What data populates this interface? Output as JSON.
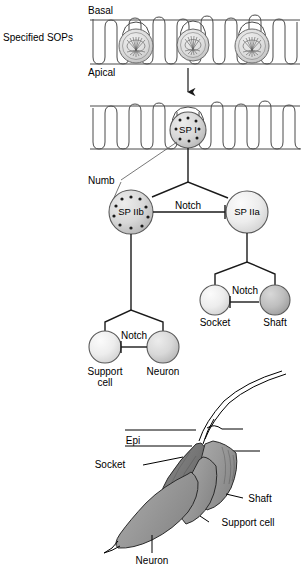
{
  "figure": {
    "title_present": false,
    "type": "biological-lineage-diagram"
  },
  "colors": {
    "cell_light": "#e8e8e8",
    "cell_mid": "#d0d0d0",
    "cell_dark": "#b8b8b8",
    "outline": "#4a4a4a",
    "line": "#1a1a1a",
    "organ_fill": "#9b9b9b",
    "organ_fill_dark": "#777777",
    "background": "#ffffff"
  },
  "panel_top": {
    "row_label": "Specified SOPs",
    "basal_label": "Basal",
    "apical_label": "Apical",
    "sop_count": 3,
    "arrow": "down-arrow"
  },
  "panel_lineage": {
    "numb_label": "Numb",
    "nodes": [
      {
        "id": "spi",
        "label": "SP I",
        "speckled": true,
        "shade": "cell_mid"
      },
      {
        "id": "spiib",
        "label": "SP IIb",
        "speckled": true,
        "shade": "cell_mid"
      },
      {
        "id": "spiia",
        "label": "SP IIa",
        "speckled": false,
        "shade": "cell_light"
      },
      {
        "id": "support",
        "label": "Support",
        "label2": "cell",
        "speckled": false,
        "shade": "cell_light"
      },
      {
        "id": "neuron",
        "label": "Neuron",
        "speckled": false,
        "shade": "cell_mid"
      },
      {
        "id": "socket",
        "label": "Socket",
        "speckled": false,
        "shade": "cell_light"
      },
      {
        "id": "shaft",
        "label": "Shaft",
        "speckled": false,
        "shade": "cell_dark"
      }
    ],
    "notch_label_1": "Notch",
    "notch_label_2": "Notch",
    "notch_label_3": "Notch"
  },
  "panel_organ": {
    "labels": {
      "epi": "Epi",
      "socket": "Socket",
      "shaft": "Shaft",
      "support_cell": "Support cell",
      "neuron": "Neuron"
    }
  }
}
